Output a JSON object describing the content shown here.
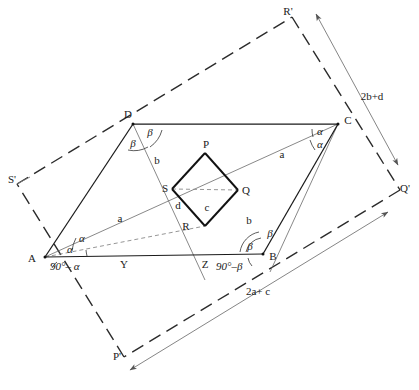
{
  "figure": {
    "stroke_dark": "#1a1a1a",
    "stroke_thin": "#6a6a6a",
    "stroke_dash": "#2b2b2b",
    "background": "#ffffff"
  },
  "vertices": {
    "A": "A",
    "B": "B",
    "C": "C",
    "D": "D",
    "P": "P",
    "Q": "Q",
    "R": "R",
    "S": "S",
    "Y": "Y",
    "Z": "Z",
    "P_prime": "P'",
    "Q_prime": "Q'",
    "R_prime": "R'",
    "S_prime": "S'"
  },
  "side_labels": {
    "a_left": "a",
    "a_right": "a",
    "b_upper": "b",
    "b_lower": "b",
    "c_inner": "c",
    "d_inner": "d"
  },
  "angles": {
    "alpha_A_upper": "α",
    "alpha_A_lower": "α",
    "alpha_C_upper": "α",
    "alpha_C_lower": "α",
    "beta_D_left": "β",
    "beta_D_right": "β",
    "beta_B_upper": "β",
    "beta_B_lower": "β",
    "complement_A": "90°– α",
    "complement_B": "90°–β"
  },
  "dimensions": {
    "vertical": "2b+d",
    "horizontal": "2a+ c"
  }
}
